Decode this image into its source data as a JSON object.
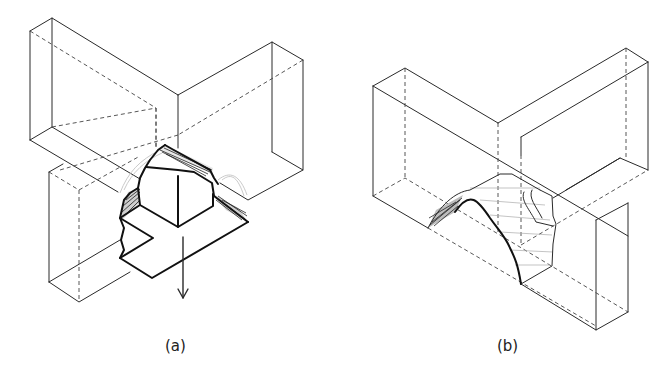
{
  "figure": {
    "panels": [
      {
        "id": "a",
        "caption": "(a)",
        "description": "T-shaped wall junction with a cone-shaped breakout block being pulled out (arrow pointing down)"
      },
      {
        "id": "b",
        "caption": "(b)",
        "description": "Wall junction showing the arch-shaped failure surface remaining after breakout"
      }
    ],
    "colors": {
      "line": "#2a2a2a",
      "hidden_line": "#444444",
      "hatch": "#222222",
      "background": "#ffffff"
    }
  }
}
